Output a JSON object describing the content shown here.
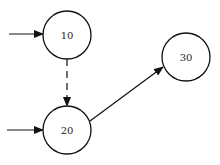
{
  "diagram": {
    "type": "state-graph",
    "nodes": [
      {
        "id": "n10",
        "label": "10",
        "cx": 67,
        "cy": 35,
        "r": 24
      },
      {
        "id": "n20",
        "label": "20",
        "cx": 67,
        "cy": 130,
        "r": 24
      },
      {
        "id": "n30",
        "label": "30",
        "cx": 186,
        "cy": 57,
        "r": 24
      }
    ],
    "edges": [
      {
        "id": "entry-10",
        "from": null,
        "to": "10",
        "style": "solid"
      },
      {
        "id": "entry-20",
        "from": null,
        "to": "20",
        "style": "solid"
      },
      {
        "id": "10-20",
        "from": "10",
        "to": "20",
        "style": "dashed"
      },
      {
        "id": "20-30",
        "from": "20",
        "to": "30",
        "style": "solid"
      }
    ]
  },
  "colors": {
    "background": "#ffffff",
    "stroke": "#111111",
    "text": "#222222"
  }
}
